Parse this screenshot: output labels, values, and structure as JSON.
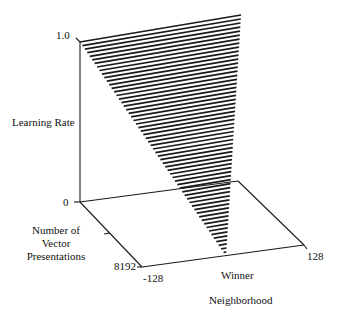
{
  "chart_data": {
    "type": "area",
    "subtype": "3d-surface-wedge",
    "title": "",
    "cut_off_title_fragment": "",
    "axes": {
      "z": {
        "label": "Learning Rate",
        "ticks": [
          "0",
          "1.0"
        ],
        "range": [
          0,
          1.0
        ]
      },
      "y": {
        "label_lines": [
          "Number of",
          "Vector",
          "Presentations"
        ],
        "ticks": [
          "0",
          "8192"
        ],
        "range": [
          0,
          8192
        ]
      },
      "x": {
        "label_lines": [
          "Winner",
          "Neighborhood"
        ],
        "ticks": [
          "-128",
          "128"
        ],
        "range": [
          -128,
          128
        ]
      }
    },
    "series": [
      {
        "name": "learning rate surface",
        "description": "Hatched wedge: learning rate 1.0 across full neighborhood at start, decaying linearly to 0 and shrinking to the winner at 8192 presentations",
        "points": [
          {
            "presentations": 0,
            "neighborhood": -128,
            "learning_rate": 1.0
          },
          {
            "presentations": 0,
            "neighborhood": 128,
            "learning_rate": 1.0
          },
          {
            "presentations": 8192,
            "neighborhood": 0,
            "learning_rate": 0.0
          }
        ]
      }
    ],
    "grid": false,
    "legend": null,
    "hatch_lines": 60
  },
  "labels": {
    "z_top": "1.0",
    "origin": "0",
    "z_axis": "Learning Rate",
    "y_axis_1": "Number of",
    "y_axis_2": "Vector",
    "y_axis_3": "Presentations",
    "y_end": "8192",
    "x_start": "-128",
    "x_end": "128",
    "x_axis_1": "Winner",
    "x_axis_2": "Neighborhood"
  }
}
